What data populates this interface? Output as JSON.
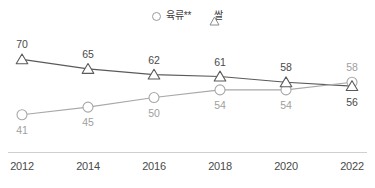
{
  "chart_data": {
    "type": "line",
    "title": "",
    "xlabel": "",
    "ylabel": "",
    "categories": [
      "2012",
      "2014",
      "2016",
      "2018",
      "2020",
      "2022"
    ],
    "series": [
      {
        "name": "육류**",
        "marker": "circle",
        "color": "#a8a8a8",
        "label_color": "#a0a0a0",
        "values": [
          41,
          45,
          50,
          54,
          54,
          58
        ],
        "label_positions": [
          "below",
          "below",
          "below",
          "below",
          "below",
          "above"
        ]
      },
      {
        "name": "쌀",
        "marker": "triangle",
        "color": "#5a5a5a",
        "label_color": "#4a4a4a",
        "values": [
          70,
          65,
          62,
          61,
          58,
          56
        ],
        "label_positions": [
          "above",
          "above",
          "above",
          "above",
          "above",
          "below"
        ]
      }
    ],
    "ylim": [
      33,
      77
    ],
    "grid": false,
    "legend_position": "top-center",
    "axis_line": "bottom-only"
  },
  "legend": {
    "items": [
      {
        "label": "육류**",
        "icon": "circle-marker-icon"
      },
      {
        "label": "쌀",
        "icon": "triangle-marker-icon"
      }
    ]
  },
  "axis": {
    "x_ticks": [
      "2012",
      "2014",
      "2016",
      "2018",
      "2020",
      "2022"
    ]
  },
  "labels": {
    "rice": [
      "70",
      "65",
      "62",
      "61",
      "58",
      "56"
    ],
    "meat": [
      "41",
      "45",
      "50",
      "54",
      "54",
      "58"
    ]
  },
  "colors": {
    "rice_line": "#5a5a5a",
    "meat_line": "#a8a8a8",
    "axis_line": "#cfcfcf",
    "background": "#ffffff",
    "text_dark": "#4a4a4a",
    "text_light": "#a0a0a0"
  }
}
